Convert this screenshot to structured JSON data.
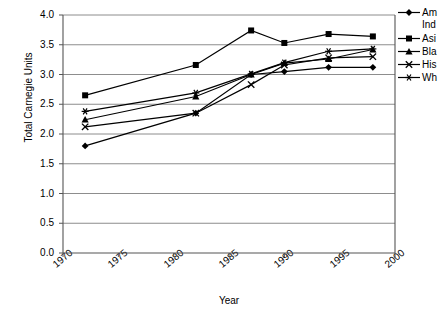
{
  "chart_data": {
    "type": "line",
    "title": "",
    "xlabel": "Year",
    "ylabel": "Total Carnegie Units",
    "xlim": [
      1970,
      2000
    ],
    "ylim": [
      0.0,
      4.0
    ],
    "xticks": [
      1970,
      1975,
      1980,
      1985,
      1990,
      1995,
      2000
    ],
    "xtick_labels": [
      "1970",
      "1975",
      "1980",
      "1985",
      "1990",
      "1995",
      "2000"
    ],
    "yticks": [
      0.0,
      0.5,
      1.0,
      1.5,
      2.0,
      2.5,
      3.0,
      3.5,
      4.0
    ],
    "ytick_labels": [
      "0.0",
      "0.5",
      "1.0",
      "1.5",
      "2.0",
      "2.5",
      "3.0",
      "3.5",
      "4.0"
    ],
    "grid": "horizontal",
    "legend_position": "right",
    "x": [
      1972,
      1982,
      1987,
      1990,
      1994,
      1998
    ],
    "series": [
      {
        "name": "American Indian",
        "legend_line1": "Am",
        "legend_line2": "Ind",
        "marker": "diamond",
        "values": [
          1.8,
          2.35,
          3.0,
          3.05,
          3.12,
          3.12
        ]
      },
      {
        "name": "Asian",
        "legend_line1": "Asi",
        "legend_line2": "",
        "marker": "square",
        "values": [
          2.65,
          3.16,
          3.74,
          3.53,
          3.68,
          3.64
        ]
      },
      {
        "name": "Black",
        "legend_line1": "Bla",
        "legend_line2": "",
        "marker": "triangle",
        "values": [
          2.24,
          2.63,
          3.0,
          3.19,
          3.26,
          3.42
        ]
      },
      {
        "name": "Hispanic",
        "legend_line1": "His",
        "legend_line2": "",
        "marker": "cross",
        "values": [
          2.12,
          2.35,
          2.83,
          3.16,
          3.28,
          3.3
        ]
      },
      {
        "name": "White",
        "legend_line1": "Wh",
        "legend_line2": "",
        "marker": "asterisk",
        "values": [
          2.38,
          2.69,
          3.01,
          3.2,
          3.39,
          3.43
        ]
      }
    ]
  },
  "axes": {
    "ylabel_text": "Total Carnegie Units",
    "xlabel_text": "Year"
  }
}
